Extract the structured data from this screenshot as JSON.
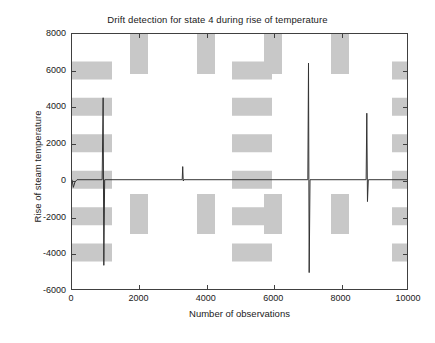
{
  "figure": {
    "background_color": "#ffffff",
    "axis_color": "#404040",
    "line_color": "#333333",
    "grid_color": "#c8c8c8"
  },
  "chart_data": {
    "type": "line",
    "title": "Drift detection for state 4 during rise of temperature",
    "xlabel": "Number of observations",
    "ylabel": "Rise of steam temperature",
    "xlim": [
      0,
      10000
    ],
    "ylim": [
      -6000,
      8000
    ],
    "xticks": [
      0,
      2000,
      4000,
      6000,
      8000,
      10000
    ],
    "xtick_labels": [
      "0",
      "2000",
      "4000",
      "6000",
      "8000",
      "10000"
    ],
    "yticks": [
      -6000,
      -4000,
      -2000,
      0,
      2000,
      4000,
      6000,
      8000
    ],
    "ytick_labels": [
      "-6000",
      "-4000",
      "-2000",
      "0",
      "2000",
      "4000",
      "6000",
      "8000"
    ],
    "grid": "dotted-minor",
    "legend": "none",
    "series": [
      {
        "name": "drift statistic",
        "description": "Near-zero baseline with four sharp bidirectional spikes marking detected drift events.",
        "baseline_value": 0,
        "points": [
          [
            0,
            0
          ],
          [
            40,
            -420
          ],
          [
            90,
            -120
          ],
          [
            150,
            0
          ],
          [
            900,
            0
          ],
          [
            930,
            4500
          ],
          [
            950,
            -4700
          ],
          [
            975,
            0
          ],
          [
            3290,
            0
          ],
          [
            3305,
            720
          ],
          [
            3320,
            -70
          ],
          [
            3340,
            0
          ],
          [
            7040,
            0
          ],
          [
            7060,
            6400
          ],
          [
            7080,
            -5100
          ],
          [
            7105,
            0
          ],
          [
            8780,
            0
          ],
          [
            8800,
            3650
          ],
          [
            8820,
            -1200
          ],
          [
            8845,
            0
          ],
          [
            10000,
            0
          ]
        ]
      }
    ],
    "spikes": [
      {
        "x": 930,
        "max": 4500,
        "min": -4700,
        "label": "spike-1"
      },
      {
        "x": 3305,
        "max": 720,
        "min": -70,
        "label": "spike-2"
      },
      {
        "x": 7060,
        "max": 6400,
        "min": -5100,
        "label": "spike-3"
      },
      {
        "x": 8800,
        "max": 3650,
        "min": -1200,
        "label": "spike-4"
      }
    ]
  }
}
